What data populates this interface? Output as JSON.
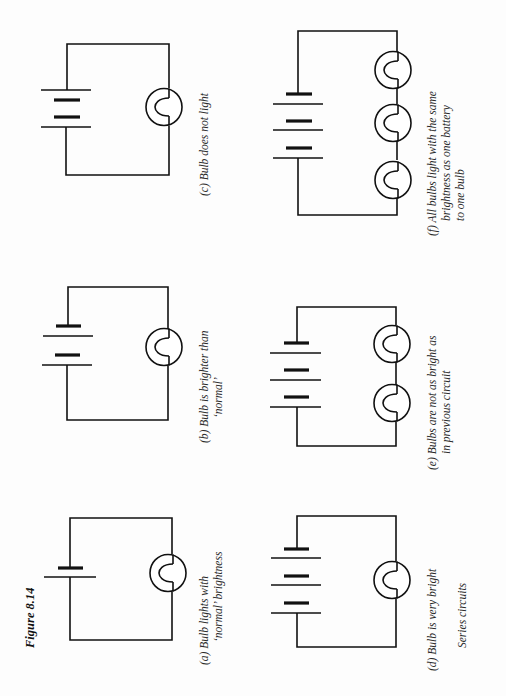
{
  "figure": {
    "title": "Figure 8.14",
    "subtitle": "Series circuits",
    "orientation": "rotated 90° counter-clockwise",
    "colors": {
      "ink": "#111111",
      "caption": "#2a2a2a",
      "paper": "#fdfdfd"
    }
  },
  "circuits": [
    {
      "id": "a",
      "cells": 1,
      "bulbs": 1,
      "caption_line1": "(a)  Bulb lights with",
      "caption_line2": "‘normal’ brightness"
    },
    {
      "id": "b",
      "cells": 2,
      "bulbs": 1,
      "caption_line1": "(b)  Bulb is brighter than",
      "caption_line2": "‘normal’"
    },
    {
      "id": "c",
      "cells": 2,
      "bulbs": 1,
      "note": "cells opposed",
      "caption_line1": "(c)  Bulb does not light"
    },
    {
      "id": "d",
      "cells": 3,
      "bulbs": 1,
      "caption_line1": "(d)  Bulb is very bright"
    },
    {
      "id": "e",
      "cells": 3,
      "bulbs": 2,
      "caption_line1": "(e)  Bulbs are not as bright as",
      "caption_line2": "in previous circuit"
    },
    {
      "id": "f",
      "cells": 3,
      "bulbs": 3,
      "caption_line1": "(f)  All bulbs light with the same",
      "caption_line2": "brightness as one battery",
      "caption_line3": "to one bulb"
    }
  ]
}
